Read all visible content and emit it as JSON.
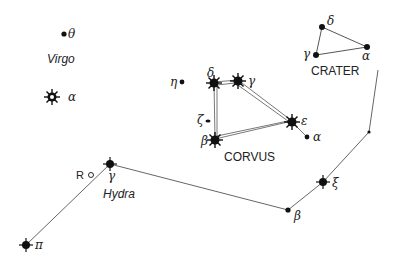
{
  "constellations": {
    "virgo": {
      "name": "Virgo",
      "stars": {
        "theta": "θ",
        "alpha": "α"
      }
    },
    "corvus": {
      "name": "CORVUS",
      "stars": {
        "eta": "η",
        "delta": "δ",
        "gamma": "γ",
        "zeta": "ζ",
        "epsilon": "ε",
        "beta": "β",
        "alpha": "α"
      }
    },
    "crater": {
      "name": "CRATER",
      "stars": {
        "delta": "δ",
        "gamma": "γ",
        "alpha": "α"
      }
    },
    "hydra": {
      "name": "Hydra",
      "stars": {
        "gamma": "γ",
        "beta": "β",
        "xi": "ξ",
        "pi": "π"
      },
      "variable": "R"
    }
  },
  "colors": {
    "ink": "#111111",
    "line": "#555555"
  }
}
